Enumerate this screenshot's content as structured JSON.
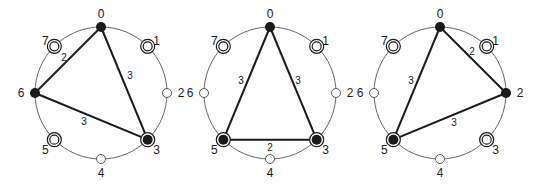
{
  "colors": {
    "ink": "#1a1a1a",
    "circle": "#555555",
    "background": "#ffffff"
  },
  "diagrams": [
    {
      "center": [
        101,
        93
      ],
      "radius": 66,
      "nodes": [
        {
          "id": "0",
          "type": "filled"
        },
        {
          "id": "1",
          "type": "double"
        },
        {
          "id": "2",
          "type": "open"
        },
        {
          "id": "3",
          "type": "filled-ring"
        },
        {
          "id": "4",
          "type": "open"
        },
        {
          "id": "5",
          "type": "double"
        },
        {
          "id": "6",
          "type": "filled"
        },
        {
          "id": "7",
          "type": "double"
        }
      ],
      "edges": [
        {
          "from": 0,
          "to": 6,
          "weight": "2",
          "label_pos": [
            64,
            57
          ]
        },
        {
          "from": 0,
          "to": 3,
          "weight": "3",
          "label_pos": [
            130,
            75
          ]
        },
        {
          "from": 6,
          "to": 3,
          "weight": "3",
          "label_pos": [
            84,
            121
          ]
        }
      ]
    },
    {
      "center": [
        270,
        93
      ],
      "radius": 66,
      "nodes": [
        {
          "id": "0",
          "type": "filled"
        },
        {
          "id": "1",
          "type": "double"
        },
        {
          "id": "2",
          "type": "open"
        },
        {
          "id": "3",
          "type": "filled-ring"
        },
        {
          "id": "4",
          "type": "open"
        },
        {
          "id": "5",
          "type": "filled-ring"
        },
        {
          "id": "6",
          "type": "open"
        },
        {
          "id": "7",
          "type": "double"
        }
      ],
      "edges": [
        {
          "from": 0,
          "to": 5,
          "weight": "3",
          "label_pos": [
            241,
            80
          ]
        },
        {
          "from": 0,
          "to": 3,
          "weight": "3",
          "label_pos": [
            298,
            80
          ]
        },
        {
          "from": 5,
          "to": 3,
          "weight": "2",
          "label_pos": [
            270,
            147
          ]
        }
      ]
    },
    {
      "center": [
        440,
        93
      ],
      "radius": 66,
      "nodes": [
        {
          "id": "0",
          "type": "filled"
        },
        {
          "id": "1",
          "type": "double"
        },
        {
          "id": "2",
          "type": "filled"
        },
        {
          "id": "3",
          "type": "double"
        },
        {
          "id": "4",
          "type": "open"
        },
        {
          "id": "5",
          "type": "filled-ring"
        },
        {
          "id": "6",
          "type": "open"
        },
        {
          "id": "7",
          "type": "double"
        }
      ],
      "edges": [
        {
          "from": 0,
          "to": 2,
          "weight": "2",
          "label_pos": [
            472,
            51
          ]
        },
        {
          "from": 0,
          "to": 5,
          "weight": "3",
          "label_pos": [
            411,
            80
          ]
        },
        {
          "from": 5,
          "to": 2,
          "weight": "3",
          "label_pos": [
            454,
            122
          ]
        }
      ]
    }
  ]
}
